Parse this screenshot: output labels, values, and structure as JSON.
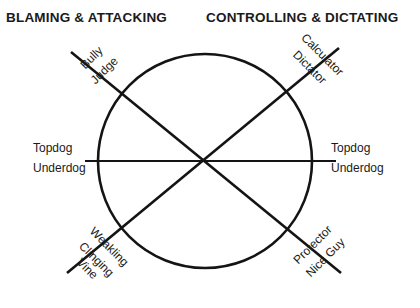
{
  "headings": {
    "left": "BLAMING & ATTACKING",
    "right": "CONTROLLING & DICTATING"
  },
  "axes": {
    "left": {
      "topdog": "Topdog",
      "underdog": "Underdog"
    },
    "right": {
      "topdog": "Topdog",
      "underdog": "Underdog"
    },
    "upper_left": {
      "topdog": "Bully",
      "underdog": "Judge"
    },
    "upper_right": {
      "topdog": "Calculator",
      "underdog": "Dictator"
    },
    "lower_left": {
      "topdog": "Weakling",
      "underdog_line1": "Clinging",
      "underdog_line2": "Vine"
    },
    "lower_right": {
      "topdog": "Protector",
      "underdog": "Nice Guy"
    }
  },
  "figure": {
    "circle": {
      "cx": 205,
      "cy": 161,
      "r": 107
    },
    "lines": [
      {
        "name": "horizontal-axis",
        "x1": 85,
        "y1": 161,
        "x2": 336,
        "y2": 161
      },
      {
        "name": "diagonal-axis-nw-se",
        "x1": 71,
        "y1": 52,
        "x2": 341,
        "y2": 273
      },
      {
        "name": "diagonal-axis-ne-sw",
        "x1": 339,
        "y1": 48,
        "x2": 67,
        "y2": 273
      }
    ],
    "stroke_color": "#141414",
    "background_color": "#ffffff"
  }
}
